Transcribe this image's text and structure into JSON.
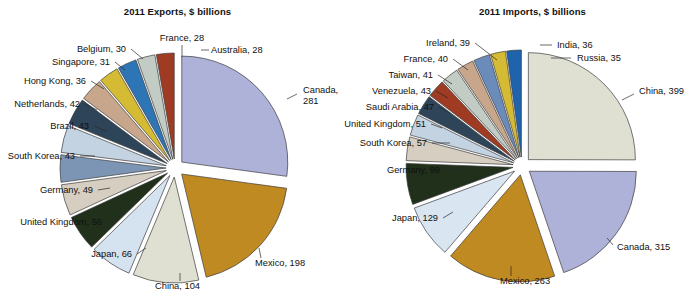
{
  "figure": {
    "width": 694,
    "height": 298,
    "background": "#ffffff"
  },
  "chart_data": [
    {
      "type": "pie",
      "id": "exports",
      "title": "2011 Exports, $ billions",
      "unit": "$ billions",
      "year": "2011",
      "total": 757,
      "exploded": true,
      "start_angle_deg": -90,
      "direction": "clockwise",
      "legend": "none",
      "labels_mode": "leader-lines",
      "categories": [
        "Canada",
        "Mexico",
        "China",
        "Japan",
        "United Kingdom",
        "Germany",
        "South Korea",
        "Brazil",
        "Netherlands",
        "Hong Kong",
        "Singapore",
        "Belgium",
        "France",
        "Australia"
      ],
      "values": [
        281,
        198,
        104,
        66,
        56,
        49,
        43,
        43,
        42,
        36,
        31,
        30,
        28,
        28
      ],
      "colors": [
        "#aeb1d8",
        "#c08a22",
        "#e0e0d2",
        "#d5e2ef",
        "#20301b",
        "#d6cec0",
        "#7c95b4",
        "#c3d3e2",
        "#2d4459",
        "#c8a68c",
        "#d5bb33",
        "#2e75b6",
        "#c2cbc4",
        "#9e3b22"
      ],
      "data_labels": [
        {
          "name": "Canada",
          "value": 281,
          "text_lines": [
            "Canada,",
            "281"
          ]
        },
        {
          "name": "Mexico",
          "value": 198,
          "text_lines": [
            "Mexico, 198"
          ]
        },
        {
          "name": "China",
          "value": 104,
          "text_lines": [
            "China, 104"
          ]
        },
        {
          "name": "Japan",
          "value": 66,
          "text_lines": [
            "Japan, 66"
          ]
        },
        {
          "name": "United Kingdom",
          "value": 56,
          "text_lines": [
            "United Kingdom, 56"
          ]
        },
        {
          "name": "Germany",
          "value": 49,
          "text_lines": [
            "Germany, 49"
          ]
        },
        {
          "name": "South Korea",
          "value": 43,
          "text_lines": [
            "South Korea, 43"
          ]
        },
        {
          "name": "Brazil",
          "value": 43,
          "text_lines": [
            "Brazil, 43"
          ]
        },
        {
          "name": "Netherlands",
          "value": 42,
          "text_lines": [
            "Netherlands, 42"
          ]
        },
        {
          "name": "Hong Kong",
          "value": 36,
          "text_lines": [
            "Hong Kong, 36"
          ]
        },
        {
          "name": "Singapore",
          "value": 31,
          "text_lines": [
            "Singapore, 31"
          ]
        },
        {
          "name": "Belgium",
          "value": 30,
          "text_lines": [
            "Belgium, 30"
          ]
        },
        {
          "name": "France",
          "value": 28,
          "text_lines": [
            "France, 28"
          ]
        },
        {
          "name": "Australia",
          "value": 28,
          "text_lines": [
            "Australia, 28"
          ]
        }
      ]
    },
    {
      "type": "pie",
      "id": "imports",
      "title": "2011 Imports, $ billions",
      "unit": "$ billions",
      "year": "2011",
      "total": 1754,
      "exploded": true,
      "start_angle_deg": -90,
      "direction": "clockwise",
      "legend": "none",
      "labels_mode": "leader-lines",
      "categories": [
        "China",
        "Canada",
        "Mexico",
        "Japan",
        "Germany",
        "South Korea",
        "United Kingdom",
        "Saudi Arabia",
        "Venezuela",
        "Taiwan",
        "France",
        "Ireland",
        "India",
        "Russia"
      ],
      "values": [
        399,
        315,
        263,
        129,
        99,
        57,
        51,
        47,
        43,
        41,
        40,
        39,
        36,
        35
      ],
      "colors": [
        "#e0e0d2",
        "#aeb1d8",
        "#c08a22",
        "#d9e6f2",
        "#20301b",
        "#d6cec0",
        "#c3d3e2",
        "#2d4459",
        "#9e3b22",
        "#c2cbc4",
        "#c8a68c",
        "#6b8cba",
        "#d5bb33",
        "#1f63ad"
      ],
      "data_labels": [
        {
          "name": "China",
          "value": 399,
          "text_lines": [
            "China, 399"
          ]
        },
        {
          "name": "Canada",
          "value": 315,
          "text_lines": [
            "Canada, 315"
          ]
        },
        {
          "name": "Mexico",
          "value": 263,
          "text_lines": [
            "Mexico, 263"
          ]
        },
        {
          "name": "Japan",
          "value": 129,
          "text_lines": [
            "Japan, 129"
          ]
        },
        {
          "name": "Germany",
          "value": 99,
          "text_lines": [
            "Germany, 99"
          ]
        },
        {
          "name": "South Korea",
          "value": 57,
          "text_lines": [
            "South Korea, 57"
          ]
        },
        {
          "name": "United Kingdom",
          "value": 51,
          "text_lines": [
            "United Kingdom, 51"
          ]
        },
        {
          "name": "Saudi Arabia",
          "value": 47,
          "text_lines": [
            "Saudi Arabia, 47"
          ]
        },
        {
          "name": "Venezuela",
          "value": 43,
          "text_lines": [
            "Venezuela, 43"
          ]
        },
        {
          "name": "Taiwan",
          "value": 41,
          "text_lines": [
            "Taiwan, 41"
          ]
        },
        {
          "name": "France",
          "value": 40,
          "text_lines": [
            "France, 40"
          ]
        },
        {
          "name": "Ireland",
          "value": 39,
          "text_lines": [
            "Ireland, 39"
          ]
        },
        {
          "name": "India",
          "value": 36,
          "text_lines": [
            "India, 36"
          ]
        },
        {
          "name": "Russia",
          "value": 35,
          "text_lines": [
            "Russia, 35"
          ]
        }
      ]
    }
  ],
  "geometry": {
    "exports": {
      "cx": 175,
      "cy": 168,
      "r": 106,
      "explode": 9,
      "labels": [
        {
          "name": "Canada",
          "tx": 303,
          "ty": 93,
          "anchor": "start",
          "lx1": 287,
          "ly1": 99,
          "lx2": 297,
          "ly2": 94
        },
        {
          "name": "Mexico",
          "tx": 255,
          "ty": 266,
          "anchor": "start",
          "lx1": 259,
          "ly1": 248,
          "lx2": 261,
          "ly2": 258
        },
        {
          "name": "China",
          "tx": 155,
          "ty": 289,
          "anchor": "start",
          "lx1": 180,
          "ly1": 273,
          "lx2": 180,
          "ly2": 281
        },
        {
          "name": "Japan",
          "tx": 132,
          "ty": 257,
          "anchor": "end",
          "lx1": 137,
          "ly1": 254,
          "lx2": 146,
          "ly2": 248
        },
        {
          "name": "United Kingdom",
          "tx": 102,
          "ty": 225,
          "anchor": "end",
          "lx1": 107,
          "ly1": 222,
          "lx2": 117,
          "ly2": 217
        },
        {
          "name": "Germany",
          "tx": 93,
          "ty": 193,
          "anchor": "end",
          "lx1": 98,
          "ly1": 190,
          "lx2": 110,
          "ly2": 188
        },
        {
          "name": "South Korea",
          "tx": 75,
          "ty": 159,
          "anchor": "end",
          "lx1": 80,
          "ly1": 156,
          "lx2": 95,
          "ly2": 156
        },
        {
          "name": "Brazil",
          "tx": 89,
          "ty": 129,
          "anchor": "end",
          "lx1": 94,
          "ly1": 126,
          "lx2": 106,
          "ly2": 131
        },
        {
          "name": "Netherlands",
          "tx": 80,
          "ty": 107,
          "anchor": "end",
          "lx1": 85,
          "ly1": 104,
          "lx2": 97,
          "ly2": 110
        },
        {
          "name": "Hong Kong",
          "tx": 86,
          "ty": 84,
          "anchor": "end",
          "lx1": 91,
          "ly1": 81,
          "lx2": 104,
          "ly2": 89
        },
        {
          "name": "Singapore",
          "tx": 110,
          "ty": 65,
          "anchor": "end",
          "lx1": 115,
          "ly1": 62,
          "lx2": 125,
          "ly2": 70
        },
        {
          "name": "Belgium",
          "tx": 126,
          "ty": 52,
          "anchor": "end",
          "lx1": 131,
          "ly1": 49,
          "lx2": 143,
          "ly2": 59
        },
        {
          "name": "France",
          "tx": 182,
          "ty": 41,
          "anchor": "mid",
          "lx1": 182,
          "ly1": 45,
          "lx2": 182,
          "ly2": 57
        },
        {
          "name": "Australia",
          "tx": 211,
          "ty": 53,
          "anchor": "start",
          "lx1": 201,
          "ly1": 50,
          "lx2": 209,
          "ly2": 50
        }
      ]
    },
    "imports": {
      "cx": 522,
      "cy": 166,
      "r": 107,
      "explode": 9,
      "labels": [
        {
          "name": "China",
          "tx": 639,
          "ty": 94,
          "anchor": "start",
          "lx1": 622,
          "ly1": 100,
          "lx2": 634,
          "ly2": 94
        },
        {
          "name": "Canada",
          "tx": 617,
          "ty": 250,
          "anchor": "start",
          "lx1": 607,
          "ly1": 238,
          "lx2": 613,
          "ly2": 245
        },
        {
          "name": "Mexico",
          "tx": 500,
          "ty": 284,
          "anchor": "start",
          "lx1": 511,
          "ly1": 266,
          "lx2": 511,
          "ly2": 276
        },
        {
          "name": "Japan",
          "tx": 438,
          "ty": 221,
          "anchor": "end",
          "lx1": 443,
          "ly1": 218,
          "lx2": 453,
          "ly2": 212
        },
        {
          "name": "Germany",
          "tx": 440,
          "ty": 173,
          "anchor": "end",
          "lx1": 445,
          "ly1": 170,
          "lx2": 461,
          "ly2": 170
        },
        {
          "name": "South Korea",
          "tx": 427,
          "ty": 146,
          "anchor": "end",
          "lx1": 432,
          "ly1": 143,
          "lx2": 450,
          "ly2": 143
        },
        {
          "name": "United Kingdom",
          "tx": 426,
          "ty": 127,
          "anchor": "end",
          "lx1": 431,
          "ly1": 124,
          "lx2": 442,
          "ly2": 128
        },
        {
          "name": "Saudi Arabia",
          "tx": 434,
          "ty": 110,
          "anchor": "end",
          "lx1": 439,
          "ly1": 107,
          "lx2": 450,
          "ly2": 113
        },
        {
          "name": "Venezuela",
          "tx": 431,
          "ty": 94,
          "anchor": "end",
          "lx1": 436,
          "ly1": 91,
          "lx2": 448,
          "ly2": 98
        },
        {
          "name": "Taiwan",
          "tx": 433,
          "ty": 78,
          "anchor": "end",
          "lx1": 438,
          "ly1": 75,
          "lx2": 452,
          "ly2": 84
        },
        {
          "name": "France",
          "tx": 448,
          "ty": 62,
          "anchor": "end",
          "lx1": 453,
          "ly1": 59,
          "lx2": 468,
          "ly2": 70
        },
        {
          "name": "Ireland",
          "tx": 470,
          "ty": 46,
          "anchor": "end",
          "lx1": 475,
          "ly1": 43,
          "lx2": 497,
          "ly2": 60
        },
        {
          "name": "India",
          "tx": 557,
          "ty": 48,
          "anchor": "start",
          "lx1": 540,
          "ly1": 45,
          "lx2": 552,
          "ly2": 45
        },
        {
          "name": "Russia",
          "tx": 577,
          "ty": 61,
          "anchor": "start",
          "lx1": 551,
          "ly1": 58,
          "lx2": 571,
          "ly2": 58
        }
      ]
    }
  }
}
